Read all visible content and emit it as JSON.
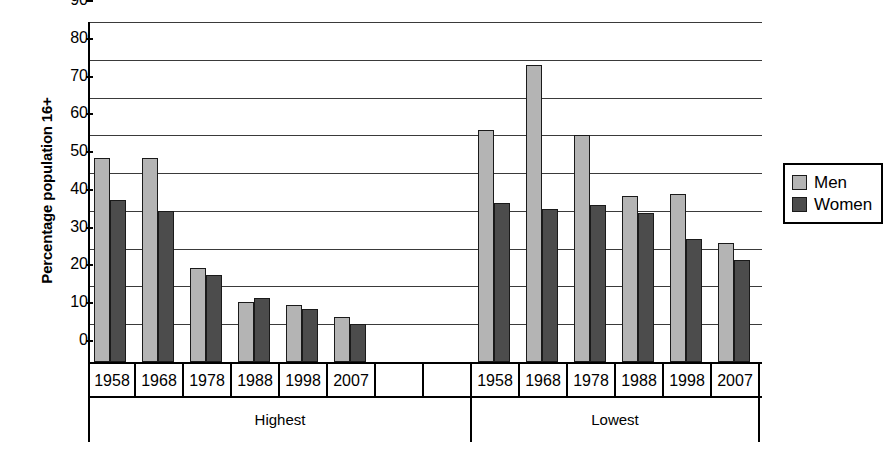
{
  "chart_data": {
    "type": "bar",
    "title": "",
    "xlabel": "",
    "ylabel": "Percentage population 16+",
    "ylim": [
      0,
      90
    ],
    "yticks": [
      0,
      10,
      20,
      30,
      40,
      50,
      60,
      70,
      80,
      90
    ],
    "ytick_labels": [
      "0",
      "10",
      "20",
      "30",
      "40",
      "50",
      "60",
      "70",
      "80",
      "90"
    ],
    "grid": true,
    "legend_position": "right",
    "legend": [
      "Men",
      "Women"
    ],
    "groups": [
      "Highest",
      "Lowest"
    ],
    "categories": [
      "1958",
      "1968",
      "1978",
      "1988",
      "1998",
      "2007"
    ],
    "series": [
      {
        "name": "Men",
        "color": "#b4b4b4",
        "values_by_group": {
          "Highest": [
            54,
            54,
            25,
            16,
            15,
            12
          ],
          "Lowest": [
            61.5,
            78.5,
            60,
            44,
            44.5,
            31.5
          ]
        }
      },
      {
        "name": "Women",
        "color": "#4c4c4c",
        "values_by_group": {
          "Highest": [
            43,
            40,
            23,
            17,
            14,
            10
          ],
          "Lowest": [
            42,
            40.5,
            41.5,
            39.5,
            32.5,
            27
          ]
        }
      }
    ],
    "axis_slots": [
      "1958",
      "1968",
      "1978",
      "1988",
      "1998",
      "2007",
      "",
      "",
      "1958",
      "1968",
      "1978",
      "1988",
      "1998",
      "2007"
    ],
    "group_spans": [
      {
        "label": "Highest",
        "start_slot": 0,
        "span": 8
      },
      {
        "label": "Lowest",
        "start_slot": 8,
        "span": 6
      }
    ]
  },
  "legend": {
    "men_label": "Men",
    "women_label": "Women"
  },
  "axis": {
    "y_title": "Percentage population 16+"
  }
}
